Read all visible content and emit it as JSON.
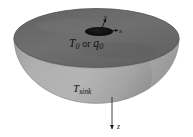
{
  "figure": {
    "body_name": "hemisphere",
    "colors": {
      "top_surface": "#6e6e6e",
      "dome_body": "#a9a9a9",
      "dome_shadow": "#8f8f8f",
      "source_patch": "#0d0d0d",
      "outline": "#5a5a5a",
      "arrow": "#1a1a1a",
      "background": "#ffffff"
    },
    "labels": {
      "source_temp": "T",
      "source_temp_sub": "0",
      "conjunction": " or ",
      "source_flux": "q",
      "source_flux_sub": "0",
      "sink": "T",
      "sink_sub": "sink",
      "axis_x": "x",
      "axis_y": "y",
      "axis_z": "z"
    },
    "elements": {
      "top_ellipse_name": "top-flat-surface",
      "dome_name": "hemisphere-body",
      "source_name": "heat-source-patch",
      "x_arrow_name": "x-axis-arrow",
      "y_arrow_name": "y-axis-arrow",
      "z_arrow_name": "z-axis-arrow"
    }
  }
}
